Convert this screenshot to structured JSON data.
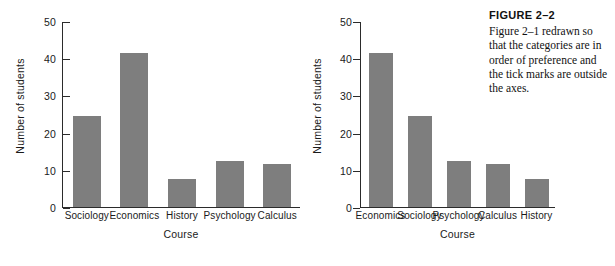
{
  "figure": {
    "caption_title": "FIGURE 2–2",
    "caption_body": "Figure 2–1 redrawn so that the categories are in order of preference and the tick marks are outside the axes.",
    "bar_color": "#7e7e7e",
    "axis_color": "#2b2b2b"
  },
  "chart_data": [
    {
      "type": "bar",
      "id": "figure-2-1",
      "title": "",
      "xlabel": "Course",
      "ylabel": "Number of students",
      "categories": [
        "Sociology",
        "Economics",
        "History",
        "Psychology",
        "Calculus"
      ],
      "values": [
        24.5,
        41.5,
        7.5,
        12.5,
        11.5
      ],
      "ylim": [
        0,
        50
      ],
      "yticks": [
        0,
        10,
        20,
        30,
        40,
        50
      ],
      "ytick_labels": [
        "0",
        "10",
        "20",
        "30",
        "40",
        "50"
      ],
      "grid": false,
      "legend": "none",
      "tick_direction": "in",
      "bar_color": "#7e7e7e"
    },
    {
      "type": "bar",
      "id": "figure-2-2",
      "title": "",
      "xlabel": "Course",
      "ylabel": "Number of students",
      "categories": [
        "Economics",
        "Sociology",
        "Psychology",
        "Calculus",
        "History"
      ],
      "values": [
        41.5,
        24.5,
        12.5,
        11.5,
        7.5
      ],
      "ylim": [
        0,
        50
      ],
      "yticks": [
        0,
        10,
        20,
        30,
        40,
        50
      ],
      "ytick_labels": [
        "0",
        "10",
        "20",
        "30",
        "40",
        "50"
      ],
      "grid": false,
      "legend": "none",
      "tick_direction": "out",
      "bar_color": "#7e7e7e"
    }
  ]
}
